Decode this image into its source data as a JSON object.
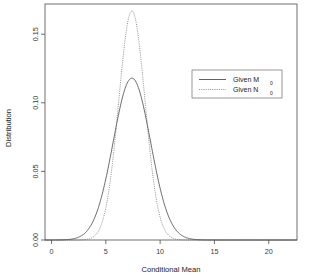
{
  "chart_data": {
    "type": "line",
    "title": "",
    "xlabel": "Conditional Mean",
    "ylabel": "Distribution",
    "xlim": [
      -0.6,
      22.6
    ],
    "ylim": [
      0.0,
      0.172
    ],
    "grid": false,
    "legend_position": "upper-right",
    "xticks": [
      0,
      5,
      10,
      15,
      20
    ],
    "xticklabels": [
      "0",
      "5",
      "10",
      "15",
      "20"
    ],
    "yticks": [
      0.0,
      0.05,
      0.1,
      0.15
    ],
    "yticklabels": [
      "0.00",
      "0.05",
      "0.10",
      "0.15"
    ],
    "series": [
      {
        "name": "Given M",
        "name_subscript": "0",
        "legend_label": "Given M",
        "legend_subscript": "0",
        "linestyle": "solid",
        "color": "#3c3c3c",
        "peak_x": 7.4,
        "peak_y": 0.118,
        "sigma": 1.72,
        "x": [
          0.0,
          1.0,
          2.0,
          2.5,
          3.0,
          3.5,
          4.0,
          4.5,
          5.0,
          5.5,
          6.0,
          6.5,
          7.0,
          7.4,
          7.8,
          8.2,
          8.6,
          9.0,
          9.5,
          10.0,
          10.5,
          11.0,
          11.5,
          12.0,
          13.0,
          14.0,
          15.0,
          17.0,
          20.0,
          22.5
        ],
        "y": [
          0.0,
          0.0002,
          0.0016,
          0.0039,
          0.0083,
          0.0157,
          0.0267,
          0.0411,
          0.0575,
          0.0735,
          0.087,
          0.1007,
          0.1097,
          0.118,
          0.1161,
          0.1095,
          0.099,
          0.0857,
          0.0673,
          0.049,
          0.0331,
          0.0207,
          0.012,
          0.0064,
          0.0014,
          0.0002,
          0.0,
          0.0,
          0.0,
          0.0
        ]
      },
      {
        "name": "Given N",
        "name_subscript": "0",
        "legend_label": "Given N",
        "legend_subscript": "0",
        "linestyle": "dotted",
        "color": "#6f6f6f",
        "peak_x": 7.4,
        "peak_y": 0.167,
        "sigma": 1.21,
        "x": [
          0.0,
          1.0,
          2.0,
          3.0,
          3.5,
          4.0,
          4.5,
          5.0,
          5.5,
          6.0,
          6.5,
          7.0,
          7.4,
          7.8,
          8.2,
          8.6,
          9.0,
          9.5,
          10.0,
          10.5,
          11.0,
          11.5,
          12.0,
          13.0,
          14.0,
          15.0,
          17.0,
          20.0,
          22.5
        ],
        "y": [
          0.0,
          0.0,
          0.0,
          0.0006,
          0.0019,
          0.005,
          0.0116,
          0.024,
          0.0443,
          0.073,
          0.1076,
          0.142,
          0.167,
          0.16,
          0.138,
          0.1088,
          0.078,
          0.045,
          0.0222,
          0.0094,
          0.0034,
          0.0011,
          0.0003,
          0.0,
          0.0,
          0.0,
          0.0,
          0.0,
          0.0
        ]
      }
    ]
  }
}
